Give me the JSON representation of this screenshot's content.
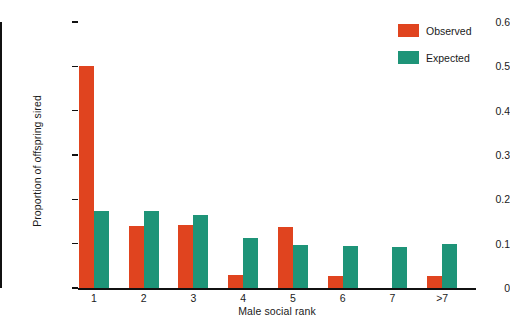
{
  "chart_data": {
    "type": "bar",
    "title": "",
    "xlabel": "Male social rank",
    "ylabel": "Proportion of offspring sired",
    "categories": [
      "1",
      "2",
      "3",
      "4",
      "5",
      "6",
      "7",
      ">7"
    ],
    "series": [
      {
        "name": "Observed",
        "color": "#e0441f",
        "values": [
          0.5,
          0.14,
          0.142,
          0.03,
          0.138,
          0.028,
          0.0,
          0.027
        ]
      },
      {
        "name": "Expected",
        "color": "#1e9478",
        "values": [
          0.173,
          0.173,
          0.165,
          0.113,
          0.097,
          0.095,
          0.092,
          0.1
        ]
      }
    ],
    "ylim": [
      0,
      0.6
    ],
    "yticks": [
      0,
      0.1,
      0.2,
      0.3,
      0.4,
      0.5,
      0.6
    ],
    "ytick_labels": [
      "0",
      "0.1",
      "0.2",
      "0.3",
      "0.4",
      "0.5",
      "0.6"
    ],
    "grid": false,
    "legend_position": "top-right"
  },
  "legend": {
    "entries": [
      {
        "label": "Observed",
        "color": "#e0441f"
      },
      {
        "label": "Expected",
        "color": "#1e9478"
      }
    ]
  }
}
